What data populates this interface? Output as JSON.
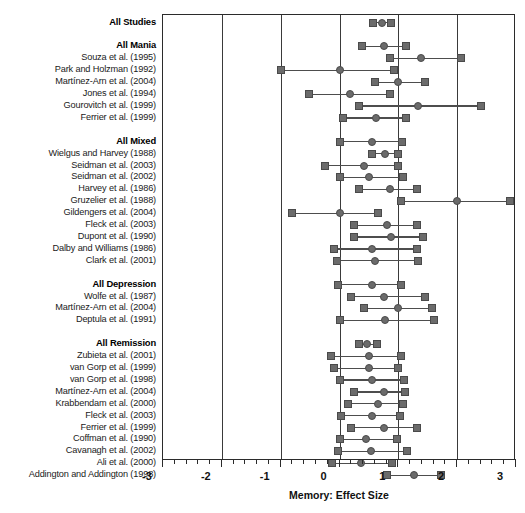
{
  "chart_data": {
    "type": "scatter",
    "title": "",
    "xlabel": "Memory: Effect Size",
    "ylabel": "",
    "xlim": [
      -3,
      3
    ],
    "xticks": [
      -3,
      -2,
      -1,
      0,
      1,
      2,
      3
    ],
    "xtick_labels": [
      "-3",
      "-2",
      "-1",
      "0",
      "1",
      "2",
      "3"
    ],
    "minor_tick_interval": 0.2,
    "grid": "vertical gridlines at every major tick",
    "legend": "none",
    "marker_shapes": {
      "estimate": "circle",
      "ci_bound": "square"
    },
    "colors": {
      "marker_fill": "#6b6b6b",
      "marker_edge": "#4a4a4a",
      "line": "#4d4d4d",
      "axis": "#2b2b2b",
      "text": "#111111"
    },
    "rows": [
      {
        "label": "All Studies",
        "group": true,
        "spacer_before": 0,
        "lower": 0.57,
        "estimate": 0.72,
        "upper": 0.87
      },
      {
        "label": "All Mania",
        "group": true,
        "spacer_before": 1,
        "lower": 0.38,
        "estimate": 0.76,
        "upper": 1.13
      },
      {
        "label": "Souza et al. (1995)",
        "group": false,
        "spacer_before": 0,
        "lower": 0.85,
        "estimate": 1.38,
        "upper": 2.06
      },
      {
        "label": "Park and Holzman (1992)",
        "group": false,
        "spacer_before": 0,
        "lower": -1.0,
        "estimate": 0.0,
        "upper": 0.93
      },
      {
        "label": "Martínez-Arn et al. (2004)",
        "group": false,
        "spacer_before": 0,
        "lower": 0.6,
        "estimate": 1.0,
        "upper": 1.46
      },
      {
        "label": "Jones et al. (1994)",
        "group": false,
        "spacer_before": 0,
        "lower": -0.52,
        "estimate": 0.17,
        "upper": 0.86
      },
      {
        "label": "Gourovitch et al. (1999)",
        "group": false,
        "spacer_before": 0,
        "lower": 0.33,
        "estimate": 1.34,
        "upper": 2.4
      },
      {
        "label": "Ferrier et al. (1999)",
        "group": false,
        "spacer_before": 0,
        "lower": 0.06,
        "estimate": 0.62,
        "upper": 1.13
      },
      {
        "label": "All Mixed",
        "group": true,
        "spacer_before": 1,
        "lower": 0.01,
        "estimate": 0.55,
        "upper": 1.07
      },
      {
        "label": "Wielgus and Harvey (1988)",
        "group": false,
        "spacer_before": 0,
        "lower": 0.55,
        "estimate": 0.77,
        "upper": 1.0
      },
      {
        "label": "Seidman et al. (2003)",
        "group": false,
        "spacer_before": 0,
        "lower": -0.25,
        "estimate": 0.42,
        "upper": 1.0
      },
      {
        "label": "Seidman et al. (2002)",
        "group": false,
        "spacer_before": 0,
        "lower": 0.01,
        "estimate": 0.5,
        "upper": 1.08
      },
      {
        "label": "Harvey et al. (1986)",
        "group": false,
        "spacer_before": 0,
        "lower": 0.33,
        "estimate": 0.85,
        "upper": 1.31
      },
      {
        "label": "Gruzelier et al. (1988)",
        "group": false,
        "spacer_before": 0,
        "lower": 1.05,
        "estimate": 2.0,
        "upper": 2.89
      },
      {
        "label": "Gildengers et al. (2004)",
        "group": false,
        "spacer_before": 0,
        "lower": -0.8,
        "estimate": 0.0,
        "upper": 0.65
      },
      {
        "label": "Fleck et al. (2003)",
        "group": false,
        "spacer_before": 0,
        "lower": 0.25,
        "estimate": 0.8,
        "upper": 1.31
      },
      {
        "label": "Dupont et al. (1990)",
        "group": false,
        "spacer_before": 0,
        "lower": 0.25,
        "estimate": 0.88,
        "upper": 1.42
      },
      {
        "label": "Dalby and Williams (1986)",
        "group": false,
        "spacer_before": 0,
        "lower": -0.1,
        "estimate": 0.56,
        "upper": 1.31
      },
      {
        "label": "Clark et al. (2001)",
        "group": false,
        "spacer_before": 0,
        "lower": -0.05,
        "estimate": 0.6,
        "upper": 1.33
      },
      {
        "label": "All Depression",
        "group": true,
        "spacer_before": 1,
        "lower": -0.02,
        "estimate": 0.56,
        "upper": 1.05
      },
      {
        "label": "Wolfe et al. (1987)",
        "group": false,
        "spacer_before": 0,
        "lower": 0.2,
        "estimate": 0.75,
        "upper": 1.45
      },
      {
        "label": "Martínez-Arn et al. (2004)",
        "group": false,
        "spacer_before": 0,
        "lower": 0.42,
        "estimate": 1.0,
        "upper": 1.58
      },
      {
        "label": "Deptula et al. (1991)",
        "group": false,
        "spacer_before": 0,
        "lower": 0.0,
        "estimate": 0.77,
        "upper": 1.6
      },
      {
        "label": "All Remission",
        "group": true,
        "spacer_before": 1,
        "lower": 0.33,
        "estimate": 0.47,
        "upper": 0.63
      },
      {
        "label": "Zubieta et al. (2001)",
        "group": false,
        "spacer_before": 0,
        "lower": -0.15,
        "estimate": 0.5,
        "upper": 1.05
      },
      {
        "label": "van Gorp et al. (1999)",
        "group": false,
        "spacer_before": 0,
        "lower": -0.1,
        "estimate": 0.5,
        "upper": 1.0
      },
      {
        "label": "van Gorp et al. (1998)",
        "group": false,
        "spacer_before": 0,
        "lower": 0.0,
        "estimate": 0.55,
        "upper": 1.1
      },
      {
        "label": "Martínez-Arn et al. (2004)",
        "group": false,
        "spacer_before": 0,
        "lower": 0.25,
        "estimate": 0.75,
        "upper": 1.12
      },
      {
        "label": "Krabbendam et al. (2000)",
        "group": false,
        "spacer_before": 0,
        "lower": 0.15,
        "estimate": 0.65,
        "upper": 1.08
      },
      {
        "label": "Fleck et al. (2003)",
        "group": false,
        "spacer_before": 0,
        "lower": 0.03,
        "estimate": 0.55,
        "upper": 1.02
      },
      {
        "label": "Ferrier et al. (1999)",
        "group": false,
        "spacer_before": 0,
        "lower": 0.2,
        "estimate": 0.75,
        "upper": 1.32
      },
      {
        "label": "Coffman et al. (1990)",
        "group": false,
        "spacer_before": 0,
        "lower": 0.0,
        "estimate": 0.45,
        "upper": 0.97
      },
      {
        "label": "Cavanagh et al. (2002)",
        "group": false,
        "spacer_before": 0,
        "lower": -0.02,
        "estimate": 0.53,
        "upper": 1.14
      },
      {
        "label": "Ali et al. (2000)",
        "group": false,
        "spacer_before": 0,
        "lower": -0.13,
        "estimate": 0.37,
        "upper": 0.9
      },
      {
        "label": "Addington and Addington (1998)",
        "group": false,
        "spacer_before": 0,
        "lower": 0.8,
        "estimate": 1.26,
        "upper": 1.72
      }
    ]
  }
}
